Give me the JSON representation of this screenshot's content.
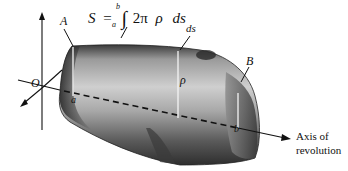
{
  "figure": {
    "formula": {
      "lhs": "S",
      "equals": "=",
      "integral": "∫",
      "lower_limit": "a",
      "upper_limit": "b",
      "integrand_coeff": "2π",
      "integrand_var": "ρ",
      "differential": "ds"
    },
    "labels": {
      "origin": "O",
      "point_a": "A",
      "point_b": "B",
      "limit_a": "a",
      "limit_b": "b",
      "radius": "ρ",
      "arc_element": "ds",
      "axis_line1": "Axis of",
      "axis_line2": "revolution"
    },
    "colors": {
      "ink": "#111111",
      "surface_dark": "#2a2a2a",
      "surface_mid": "#8a8a8a",
      "surface_light": "#d0d0d0",
      "background": "#ffffff"
    }
  }
}
